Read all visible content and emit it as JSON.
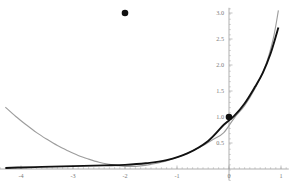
{
  "chart_data": {
    "type": "line",
    "title": "",
    "subtitle": "",
    "xlabel": "",
    "ylabel": "",
    "xlim": [
      -4.4,
      1.15
    ],
    "ylim": [
      -0.22,
      3.1
    ],
    "grid": false,
    "legend": null,
    "x_ticks": [
      -4,
      -3,
      -2,
      -1,
      0,
      1
    ],
    "x_tick_labels": [
      "-4",
      "-3",
      "-2",
      "-1",
      "0",
      "1"
    ],
    "y_ticks": [
      0.5,
      1.0,
      1.5,
      2.0,
      2.5,
      3.0
    ],
    "y_tick_labels": [
      "0.5",
      "1.0",
      "1.5",
      "2.0",
      "2.5",
      "3.0"
    ],
    "x_minor_step": 0.1,
    "y_minor_step": 0.1,
    "axis_color": "#8d8d8d",
    "tick_label_color": "#7a7a7a",
    "series": [
      {
        "name": "gray-curve",
        "color": "#9d9d9d",
        "width": 1.15,
        "kind": "quadratic",
        "note": "upward parabola, vertex near x=-2, passes through (0,1)",
        "x": [
          -4.3,
          -4.1,
          -3.9,
          -3.7,
          -3.5,
          -3.3,
          -3.1,
          -2.9,
          -2.7,
          -2.5,
          -2.3,
          -2.1,
          -1.9,
          -1.7,
          -1.5,
          -1.3,
          -1.1,
          -0.9,
          -0.7,
          -0.5,
          -0.3,
          -0.1,
          0.1,
          0.3,
          0.5,
          0.7,
          0.85,
          0.95
        ],
        "y": [
          1.19,
          1.01,
          0.85,
          0.7,
          0.57,
          0.45,
          0.35,
          0.26,
          0.19,
          0.13,
          0.09,
          0.06,
          0.05,
          0.06,
          0.09,
          0.13,
          0.19,
          0.26,
          0.35,
          0.45,
          0.57,
          0.7,
          0.98,
          1.22,
          1.55,
          1.98,
          2.5,
          3.05
        ]
      },
      {
        "name": "black-curve",
        "color": "#111111",
        "width": 1.9,
        "kind": "exponential-like",
        "note": "nearly flat along axis left of -2, rises to the right of 0",
        "x": [
          -4.3,
          -4.0,
          -3.6,
          -3.2,
          -2.8,
          -2.4,
          -2.0,
          -1.6,
          -1.2,
          -0.8,
          -0.4,
          -0.1,
          0.1,
          0.3,
          0.5,
          0.65,
          0.8,
          0.95
        ],
        "y": [
          0.02,
          0.03,
          0.04,
          0.05,
          0.06,
          0.07,
          0.08,
          0.11,
          0.17,
          0.3,
          0.54,
          0.85,
          1.02,
          1.26,
          1.58,
          1.85,
          2.22,
          2.72
        ]
      }
    ],
    "points": [
      {
        "name": "upper-point",
        "x": -2,
        "y": 3.0,
        "color": "#101010",
        "radius": 3.3
      },
      {
        "name": "origin-point",
        "x": 0,
        "y": 1.0,
        "color": "#101010",
        "radius": 3.3
      }
    ]
  }
}
